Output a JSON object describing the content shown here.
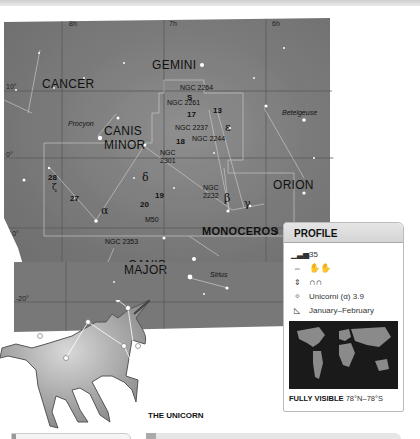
{
  "map": {
    "ra_labels": [
      "8h",
      "7h",
      "6h"
    ],
    "dec_labels": [
      "10°",
      "0°",
      "-10°",
      "-20°"
    ],
    "constellations": [
      "GEMINI",
      "CANCER",
      "CANIS MINOR",
      "ORION",
      "MONOCEROS",
      "CANIS MAJOR"
    ],
    "canis_minor_line1": "CANIS",
    "canis_minor_line2": "MINOR",
    "canis_major_line1": "CANIS",
    "canis_major_line2": "MAJOR",
    "stars": {
      "procyon": "Procyon",
      "betelgeuse": "Betelgeuse",
      "sirius": "Sirius"
    },
    "objects": {
      "ngc2264": "NGC 2264",
      "ngc2261": "NGC 2261",
      "ngc2237": "NGC 2237",
      "ngc2244": "NGC 2244",
      "ngc2301_a": "NGC",
      "ngc2301_b": "2301",
      "ngc2232_a": "NGC",
      "ngc2232_b": "2232",
      "m50": "M50",
      "ngc2353": "NGC 2353"
    },
    "numbers": {
      "s": "S",
      "n13": "13",
      "n17": "17",
      "n18": "18",
      "n19": "19",
      "n20": "20",
      "n27": "27",
      "n28": "28",
      "n3": "3"
    },
    "greek": {
      "alpha": "α",
      "beta": "β",
      "gamma": "γ",
      "delta": "δ",
      "epsilon": "ε",
      "zeta": "ζ"
    }
  },
  "profile": {
    "title": "PROFILE",
    "size_rank": "35",
    "brightest_star": "Unicorni (α) 3.9",
    "best_seen": "January–February",
    "visible_label": "FULLY VISIBLE",
    "visible_range": "78°N–78°S"
  },
  "figure_caption": "THE UNICORN"
}
